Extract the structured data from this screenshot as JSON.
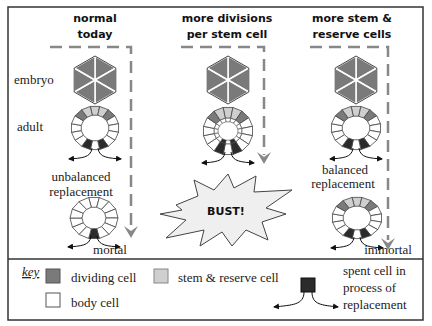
{
  "columns": [
    {
      "title_line1": "normal",
      "title_line2": "today",
      "caption_line1": "unbalanced",
      "caption_line2": "replacement",
      "outcome": "mortal"
    },
    {
      "title_line1": "more divisions",
      "title_line2": "per stem cell",
      "outcome": "BUST!"
    },
    {
      "title_line1": "more stem &",
      "title_line2": "reserve cells",
      "caption_line1": "balanced",
      "caption_line2": "replacement",
      "outcome": "immortal"
    }
  ],
  "row_labels": {
    "embryo": "embryo",
    "adult": "adult"
  },
  "key": {
    "title": "key",
    "items": [
      {
        "label": "dividing cell",
        "color": "#7a7a7a"
      },
      {
        "label": "stem & reserve cell",
        "color": "#cfcfcf"
      },
      {
        "label": "body cell",
        "color": "#ffffff"
      },
      {
        "label_line1": "spent cell in",
        "label_line2": "process of",
        "label_line3": "replacement",
        "color": "#2b2b2b"
      }
    ]
  },
  "colors": {
    "dividing": "#7a7a7a",
    "stem": "#cfcfcf",
    "body": "#ffffff",
    "spent": "#2b2b2b",
    "arrow": "#888888",
    "border": "#333333"
  }
}
